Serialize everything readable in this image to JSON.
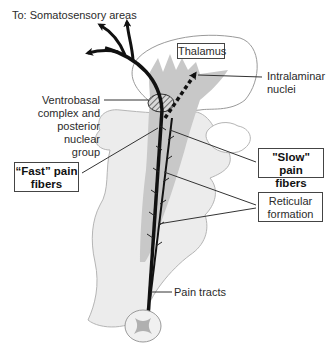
{
  "labels": {
    "top": "To: Somatosensory areas",
    "thalamus": "Thalamus",
    "intralaminar": [
      "Intralaminar",
      "nuclei"
    ],
    "ventrobasal": [
      "Ventrobasal",
      "complex and",
      "posterior",
      "nuclear",
      "group"
    ],
    "fast_fibers": [
      "“Fast” pain",
      "fibers"
    ],
    "slow_fibers": [
      "\"Slow\" pain",
      "fibers"
    ],
    "reticular": [
      "Reticular",
      "formation"
    ],
    "pain_tracts": "Pain tracts"
  },
  "colors": {
    "brainstem_fill": "#ececec",
    "tract_fill": "#c8c8c8",
    "outline": "#9a9a9a",
    "fiber": "#111111"
  }
}
